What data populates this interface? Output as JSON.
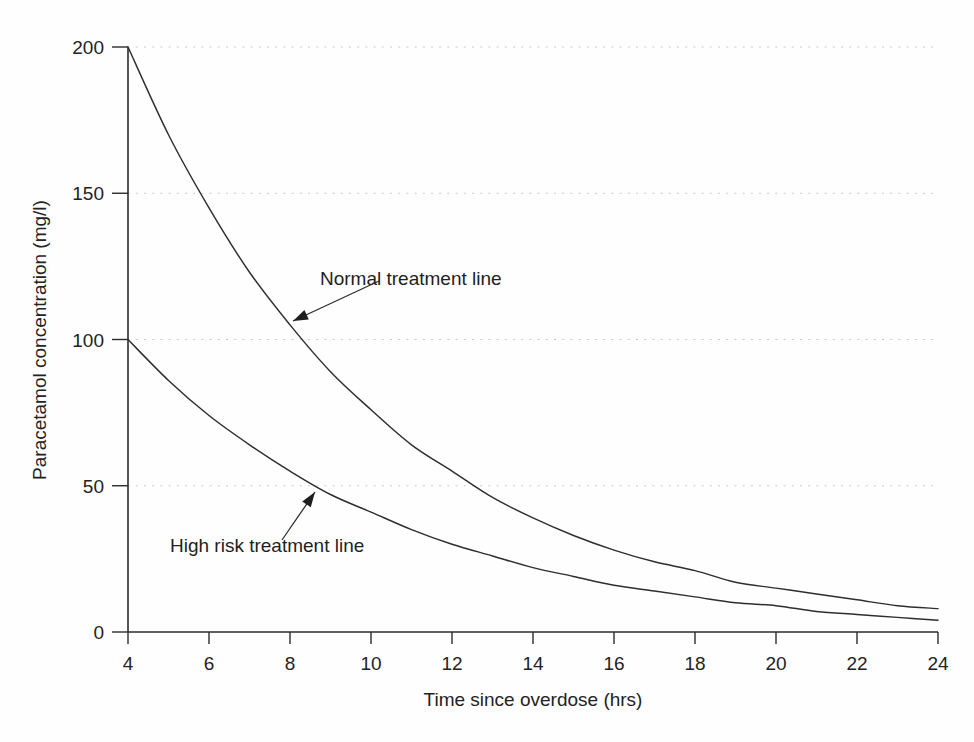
{
  "chart_data": {
    "type": "line",
    "title": "",
    "xlabel": "Time since overdose (hrs)",
    "ylabel": "Paracetamol concentration (mg/l)",
    "xlim": [
      4,
      24
    ],
    "ylim": [
      0,
      200
    ],
    "xticks": [
      4,
      6,
      8,
      10,
      12,
      14,
      16,
      18,
      20,
      22,
      24
    ],
    "yticks": [
      0,
      50,
      100,
      150,
      200
    ],
    "xtick_labels": [
      "4",
      "6",
      "8",
      "10",
      "12",
      "14",
      "16",
      "18",
      "20",
      "22",
      "24"
    ],
    "ytick_labels": [
      "0",
      "50",
      "100",
      "150",
      "200"
    ],
    "grid": "horizontal-dotted",
    "legend": "none",
    "x": [
      4,
      5,
      6,
      7,
      8,
      9,
      10,
      11,
      12,
      13,
      14,
      15,
      16,
      17,
      18,
      19,
      20,
      21,
      22,
      23,
      24
    ],
    "series": [
      {
        "name": "Normal treatment line",
        "values": [
          200,
          170,
          145,
          123,
          105,
          89,
          76,
          64,
          55,
          46,
          39,
          33,
          28,
          24,
          21,
          17,
          15,
          13,
          11,
          9,
          8
        ]
      },
      {
        "name": "High risk treatment line",
        "values": [
          100,
          86,
          74,
          64,
          55,
          47,
          41,
          35,
          30,
          26,
          22,
          19,
          16,
          14,
          12,
          10,
          9,
          7,
          6,
          5,
          4
        ]
      }
    ],
    "annotations": [
      {
        "text": "Normal treatment line",
        "label_x": 320,
        "label_y": 285,
        "arrow_from_x": 379,
        "arrow_from_y": 281,
        "arrow_to_x": 293,
        "arrow_to_y": 321
      },
      {
        "text": "High risk treatment line",
        "label_x": 170,
        "label_y": 552,
        "arrow_from_x": 282,
        "arrow_from_y": 540,
        "arrow_to_x": 315,
        "arrow_to_y": 492
      }
    ]
  },
  "figure": {
    "background_color": "#fefefe",
    "curve_color": "#2e2e2e",
    "axis_color": "#2b2b2b",
    "grid_color": "#c9c9c9"
  }
}
